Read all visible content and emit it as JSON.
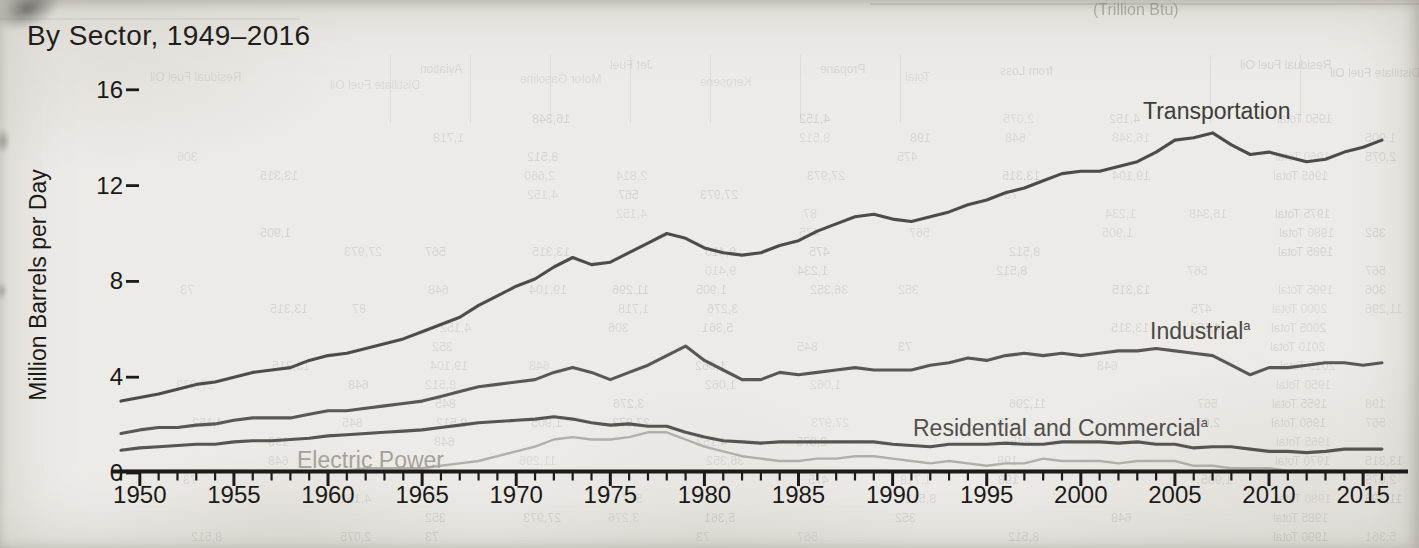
{
  "chart_data": {
    "type": "line",
    "title": "By Sector, 1949–2016",
    "subtitle": "",
    "xlabel": "",
    "ylabel": "Million Barrels per Day",
    "units": "million barrels per day",
    "x_start": 1949,
    "x_end": 2016,
    "x_step": 1,
    "ylim": [
      0,
      16
    ],
    "y_ticks": [
      0,
      4,
      8,
      12,
      16
    ],
    "x_tick_labels": [
      1950,
      1955,
      1960,
      1965,
      1970,
      1975,
      1980,
      1985,
      1990,
      1995,
      2000,
      2005,
      2010,
      2015
    ],
    "x_minor_ticks_every_year": true,
    "grid": false,
    "legend_position": "inline-labels-on-chart",
    "axis_color": "#1c1b19",
    "series": [
      {
        "name": "Transportation",
        "label": "Transportation",
        "sup": "",
        "color": "#4d4c4a",
        "label_color": "#3e3d3b",
        "values": [
          3.0,
          3.15,
          3.3,
          3.5,
          3.7,
          3.8,
          4.0,
          4.2,
          4.3,
          4.4,
          4.7,
          4.9,
          5.0,
          5.2,
          5.4,
          5.6,
          5.9,
          6.2,
          6.5,
          7.0,
          7.4,
          7.8,
          8.1,
          8.6,
          9.0,
          8.7,
          8.8,
          9.2,
          9.6,
          10.0,
          9.8,
          9.4,
          9.2,
          9.1,
          9.2,
          9.5,
          9.7,
          10.1,
          10.4,
          10.7,
          10.8,
          10.6,
          10.5,
          10.7,
          10.9,
          11.2,
          11.4,
          11.7,
          11.9,
          12.2,
          12.5,
          12.6,
          12.6,
          12.8,
          13.0,
          13.4,
          13.9,
          14.0,
          14.2,
          13.7,
          13.3,
          13.4,
          13.2,
          13.0,
          13.1,
          13.4,
          13.6,
          13.9
        ]
      },
      {
        "name": "Industrial",
        "label": "Industrial",
        "sup": "a",
        "color": "#595855",
        "label_color": "#494846",
        "values": [
          1.65,
          1.8,
          1.9,
          1.9,
          2.0,
          2.05,
          2.2,
          2.3,
          2.3,
          2.3,
          2.45,
          2.6,
          2.6,
          2.7,
          2.8,
          2.9,
          3.0,
          3.2,
          3.4,
          3.6,
          3.7,
          3.8,
          3.9,
          4.2,
          4.4,
          4.2,
          3.9,
          4.2,
          4.5,
          4.9,
          5.3,
          4.7,
          4.3,
          3.9,
          3.9,
          4.2,
          4.1,
          4.2,
          4.3,
          4.4,
          4.3,
          4.3,
          4.3,
          4.5,
          4.6,
          4.8,
          4.7,
          4.9,
          5.0,
          4.9,
          5.0,
          4.9,
          5.0,
          5.1,
          5.1,
          5.2,
          5.1,
          5.0,
          4.9,
          4.5,
          4.1,
          4.4,
          4.4,
          4.5,
          4.6,
          4.6,
          4.5,
          4.6
        ]
      },
      {
        "name": "Residential and Commercial",
        "label": "Residential and Commercial",
        "sup": "a",
        "color": "#565553",
        "label_color": "#504f4d",
        "values": [
          0.95,
          1.05,
          1.1,
          1.15,
          1.2,
          1.2,
          1.3,
          1.35,
          1.35,
          1.4,
          1.45,
          1.55,
          1.6,
          1.65,
          1.7,
          1.75,
          1.8,
          1.9,
          2.0,
          2.1,
          2.15,
          2.2,
          2.25,
          2.35,
          2.25,
          2.1,
          2.0,
          2.05,
          1.95,
          1.95,
          1.7,
          1.5,
          1.35,
          1.3,
          1.25,
          1.3,
          1.3,
          1.3,
          1.3,
          1.3,
          1.3,
          1.2,
          1.15,
          1.1,
          1.2,
          1.2,
          1.2,
          1.25,
          1.2,
          1.2,
          1.3,
          1.3,
          1.3,
          1.25,
          1.3,
          1.2,
          1.2,
          1.05,
          1.1,
          1.1,
          1.0,
          0.9,
          0.9,
          0.85,
          0.9,
          1.0,
          1.0,
          1.0
        ]
      },
      {
        "name": "Electric Power",
        "label": "Electric Power",
        "sup": "",
        "color": "#b2afaa",
        "label_color": "#a5a19b",
        "values": [
          0.1,
          0.1,
          0.1,
          0.1,
          0.1,
          0.1,
          0.1,
          0.1,
          0.1,
          0.1,
          0.1,
          0.1,
          0.1,
          0.2,
          0.2,
          0.2,
          0.2,
          0.3,
          0.4,
          0.5,
          0.7,
          0.9,
          1.1,
          1.4,
          1.5,
          1.4,
          1.4,
          1.5,
          1.7,
          1.7,
          1.4,
          1.1,
          0.9,
          0.7,
          0.6,
          0.5,
          0.5,
          0.6,
          0.6,
          0.7,
          0.7,
          0.6,
          0.5,
          0.4,
          0.5,
          0.4,
          0.3,
          0.4,
          0.4,
          0.6,
          0.5,
          0.5,
          0.5,
          0.4,
          0.5,
          0.5,
          0.5,
          0.3,
          0.3,
          0.2,
          0.2,
          0.2,
          0.1,
          0.1,
          0.1,
          0.1,
          0.1,
          0.1
        ]
      }
    ]
  },
  "bleedthrough_artifact": {
    "description": "faint mirrored show-through of a data table printed on the reverse page",
    "top_right_text": "(Trillion Btu)",
    "header_fragments": [
      "Residual Fuel Oil",
      "Distillate Fuel Oil",
      "Aviation",
      "Motor Gasoline",
      "Jet Fuel",
      "Kerosene",
      "Propane",
      "Total",
      "from Loss"
    ],
    "row_label_fragments": [
      "1950 Total",
      "1955 Total",
      "1960 Total",
      "1965 Total",
      "1970 Total",
      "1975 Total",
      "1980 Total",
      "1985 Total",
      "1990 Total",
      "1995 Total",
      "2000 Total",
      "2005 Total",
      "2010 Total",
      "2015 Total"
    ],
    "number_fragments": [
      "2,814",
      "1,062",
      "3,276",
      "16,348",
      "475",
      "1,718",
      "8,512",
      "36,352",
      "2,660",
      "198",
      "13,315",
      "1,234",
      "567",
      "9,410",
      "306",
      "4,152",
      "27,973",
      "845",
      "62",
      "1,905",
      "73",
      "11,296",
      "352",
      "2,075",
      "648",
      "19,104",
      "87",
      "5,361"
    ]
  }
}
